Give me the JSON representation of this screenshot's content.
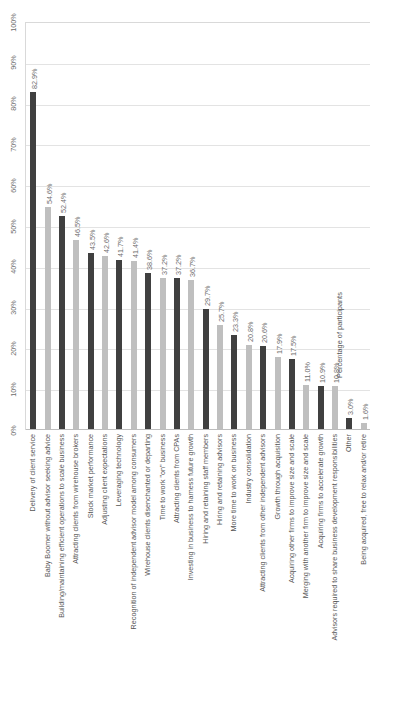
{
  "chart_data": {
    "type": "bar",
    "title": "",
    "xlabel": "",
    "ylabel": "Percentage of participants",
    "ylim": [
      0,
      100
    ],
    "grid": true,
    "legend": "none",
    "orientation": "vertical",
    "tick_labels": [
      "100%",
      "90%",
      "80%",
      "70%",
      "60%",
      "50%",
      "40%",
      "30%",
      "20%",
      "10%",
      "0%"
    ],
    "tick_values": [
      100,
      90,
      80,
      70,
      60,
      50,
      40,
      30,
      20,
      10,
      0
    ],
    "value_label_suffix": "%",
    "colors": {
      "bar_dark": "#404040",
      "bar_light": "#bfbfbf",
      "gridline": "#e3e3e3",
      "axis": "#bdbdbd",
      "text": "#5a5a5a"
    },
    "categories": [
      "Delivery of client service",
      "Baby Boomer without advisor seeking advice",
      "Building/maintaining efficient operations to scale business",
      "Attracting clients from wirehouse brokers",
      "Stock market performance",
      "Adjusting client expectations",
      "Leveraging technology",
      "Recognition of independent advisor model among consumers",
      "Wirehouse clients disenchanted or departing",
      "Time to work \"on\" business",
      "Attracting clients from CPAs",
      "Investing in business to harness future growth",
      "Hiring and retaining staff members",
      "Hiring and retaining advisors",
      "More time to work on business",
      "Industry consolidation",
      "Attracting clients from other independent advisors",
      "Growth through acquisition",
      "Acquiring other firms to improve size and scale",
      "Merging with another firm to improve size and scale",
      "Acquiring firms to accelerate growth",
      "Advisors required to share business development responsibilities",
      "Other",
      "Being acquired, free to relax and/or retire"
    ],
    "values": [
      82.9,
      54.6,
      52.4,
      46.5,
      43.5,
      42.6,
      41.7,
      41.4,
      38.6,
      37.2,
      37.2,
      36.7,
      29.7,
      25.7,
      23.3,
      20.8,
      20.6,
      17.9,
      17.5,
      11.0,
      10.9,
      10.8,
      3.0,
      1.6
    ],
    "value_labels": [
      "82.9%",
      "54.6%",
      "52.4%",
      "46.5%",
      "43.5%",
      "42.6%",
      "41.7%",
      "41.4%",
      "38.6%",
      "37.2%",
      "37.2%",
      "36.7%",
      "29.7%",
      "25.7%",
      "23.3%",
      "20.8%",
      "20.6%",
      "17.9%",
      "17.5%",
      "11.0%",
      "10.9%",
      "10.8%",
      "3.0%",
      "1.6%"
    ],
    "bar_shades": [
      "dark",
      "light",
      "dark",
      "light",
      "dark",
      "light",
      "dark",
      "light",
      "dark",
      "light",
      "dark",
      "light",
      "dark",
      "light",
      "dark",
      "light",
      "dark",
      "light",
      "dark",
      "light",
      "dark",
      "light",
      "dark",
      "light"
    ]
  }
}
